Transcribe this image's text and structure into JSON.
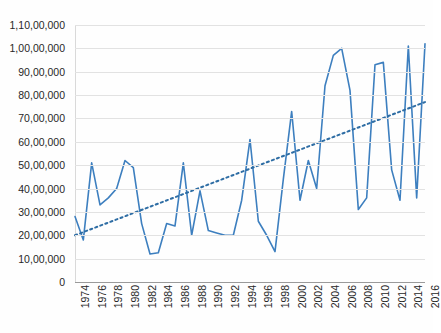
{
  "chart_data": {
    "type": "line",
    "title": "",
    "xlabel": "",
    "ylabel": "",
    "ylim": [
      0,
      11000000
    ],
    "ytick_step": 1000000,
    "grid": true,
    "legend": "none",
    "y_tick_labels": [
      "1,10,00,000",
      "1,00,00,000",
      "90,00,000",
      "80,00,000",
      "70,00,000",
      "60,00,000",
      "50,00,000",
      "40,00,000",
      "30,00,000",
      "20,00,000",
      "10,00,000",
      "0"
    ],
    "y_tick_values": [
      11000000,
      10000000,
      9000000,
      8000000,
      7000000,
      6000000,
      5000000,
      4000000,
      3000000,
      2000000,
      1000000,
      0
    ],
    "x_tick_labels": [
      "1974",
      "1976",
      "1978",
      "1980",
      "1982",
      "1984",
      "1986",
      "1988",
      "1990",
      "1992",
      "1994",
      "1996",
      "1998",
      "2000",
      "2002",
      "2004",
      "2006",
      "2008",
      "2010",
      "2012",
      "2014",
      "2016"
    ],
    "x_tick_values": [
      1974,
      1976,
      1978,
      1980,
      1982,
      1984,
      1986,
      1988,
      1990,
      1992,
      1994,
      1996,
      1998,
      2000,
      2002,
      2004,
      2006,
      2008,
      2010,
      2012,
      2014,
      2016
    ],
    "x": [
      1974,
      1975,
      1976,
      1977,
      1978,
      1979,
      1980,
      1981,
      1982,
      1983,
      1984,
      1985,
      1986,
      1987,
      1988,
      1989,
      1990,
      1991,
      1992,
      1993,
      1994,
      1995,
      1996,
      1997,
      1998,
      1999,
      2000,
      2001,
      2002,
      2003,
      2004,
      2005,
      2006,
      2007,
      2008,
      2009,
      2010,
      2011,
      2012,
      2013,
      2014,
      2015,
      2016
    ],
    "series": [
      {
        "name": "Annual value",
        "color": "#3d7fbf",
        "style": "solid",
        "values": [
          2800000,
          1800000,
          5100000,
          3300000,
          3600000,
          4000000,
          5200000,
          4900000,
          2500000,
          1200000,
          1250000,
          2500000,
          2400000,
          5100000,
          2000000,
          3900000,
          2200000,
          2100000,
          2000000,
          2000000,
          3500000,
          6100000,
          2600000,
          2000000,
          1300000,
          4400000,
          7300000,
          3500000,
          5200000,
          4000000,
          8400000,
          9700000,
          10000000,
          8200000,
          3100000,
          3600000,
          9300000,
          9400000,
          4800000,
          3500000,
          10100000,
          3600000,
          10200000
        ]
      },
      {
        "name": "Linear trendline",
        "color": "#3d7fbf",
        "style": "dotted",
        "values_endpoints": [
          2000000,
          7700000
        ]
      }
    ]
  },
  "axes": {
    "y_axis_name": "y-axis",
    "x_axis_name": "x-axis"
  }
}
